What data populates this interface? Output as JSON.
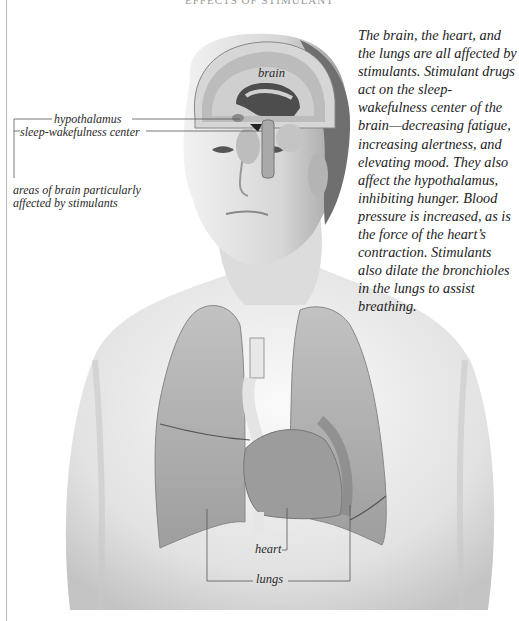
{
  "page": {
    "title_fragment": "EFFECTS OF STIMULANTS",
    "description": "The brain, the heart, and the lungs are all affected by stimulants. Stimulant drugs act on the sleep-wakefulness center of the brain—decreasing fatigue, increasing alertness, and elevating mood. They also affect the hypothalamus, inhibiting hunger. Blood pressure is increased, as is the force of the heart’s contraction. Stimulants also dilate the bronchioles in the lungs to assist breathing."
  },
  "labels": {
    "brain": "brain",
    "hypothalamus": "hypothalamus",
    "sleep_wakefulness_center": "sleep-wakefulness center",
    "areas": "areas of brain particularly affected by stimulants",
    "heart": "heart",
    "lungs": "lungs"
  },
  "colors": {
    "background": "#ffffff",
    "skin": "#e6e6e6",
    "skin_shadow": "#bdbdbd",
    "brain_cortex": "#bcbcbc",
    "brain_highlight": "#5a5a5a",
    "lung": "#a9a9a9",
    "heart": "#9a9a9a",
    "leader_line": "#555555",
    "text": "#222222"
  }
}
